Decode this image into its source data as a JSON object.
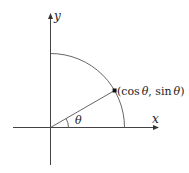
{
  "diagram": {
    "labels": {
      "x_axis": "x",
      "y_axis": "y",
      "angle": "θ",
      "point_open": "(",
      "point_cos": "cos",
      "point_theta1": "θ",
      "point_sep": ", ",
      "point_sin": "sin",
      "point_theta2": "θ",
      "point_close": ")"
    },
    "point_label": "(cos θ, sin θ)",
    "angle_degrees": 30,
    "colors": {
      "stroke": "#444444",
      "text": "#222222",
      "background": "#ffffff"
    }
  }
}
